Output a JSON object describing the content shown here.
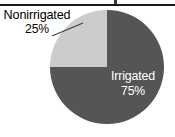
{
  "figure": {
    "background_color": "#ffffff",
    "top_rule_color": "#1a1a1a"
  },
  "chart_data": {
    "type": "pie",
    "title": "",
    "xlabel": "",
    "ylabel": "",
    "grid": false,
    "legend_position": "none",
    "labels_inline": true,
    "categories": [
      "Irrigated",
      "Nonirrigated"
    ],
    "values": [
      75,
      25
    ],
    "value_unit": "%",
    "start_angle_deg": 0,
    "direction": "clockwise",
    "colors": [
      "#555555",
      "#cccccc"
    ],
    "slices": [
      {
        "name": "Irrigated",
        "value": 75,
        "value_label": "75%",
        "color": "#555555",
        "label_color": "#ffffff",
        "label_placement": "inside"
      },
      {
        "name": "Nonirrigated",
        "value": 25,
        "value_label": "25%",
        "color": "#cccccc",
        "label_color": "#000000",
        "label_placement": "outside-callout"
      }
    ]
  },
  "labels": {
    "nonirrigated": {
      "name": "Nonirrigated",
      "value": "25%"
    },
    "irrigated": {
      "name": "Irrigated",
      "value": "75%"
    }
  }
}
